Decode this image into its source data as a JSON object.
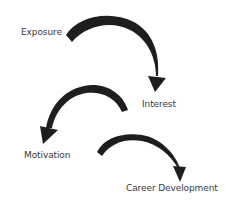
{
  "diagram": {
    "type": "flow",
    "stages": [
      {
        "label": "Exposure"
      },
      {
        "label": "Interest"
      },
      {
        "label": "Motivation"
      },
      {
        "label": "Career Development"
      }
    ],
    "arrows": [
      {
        "from": "Exposure",
        "to": "Interest"
      },
      {
        "from": "Interest",
        "to": "Motivation"
      },
      {
        "from": "Motivation",
        "to": "Career Development"
      }
    ],
    "colors": {
      "arrow": "#1e1e1e",
      "text": "#3a3a3a",
      "background": "#ffffff"
    }
  }
}
